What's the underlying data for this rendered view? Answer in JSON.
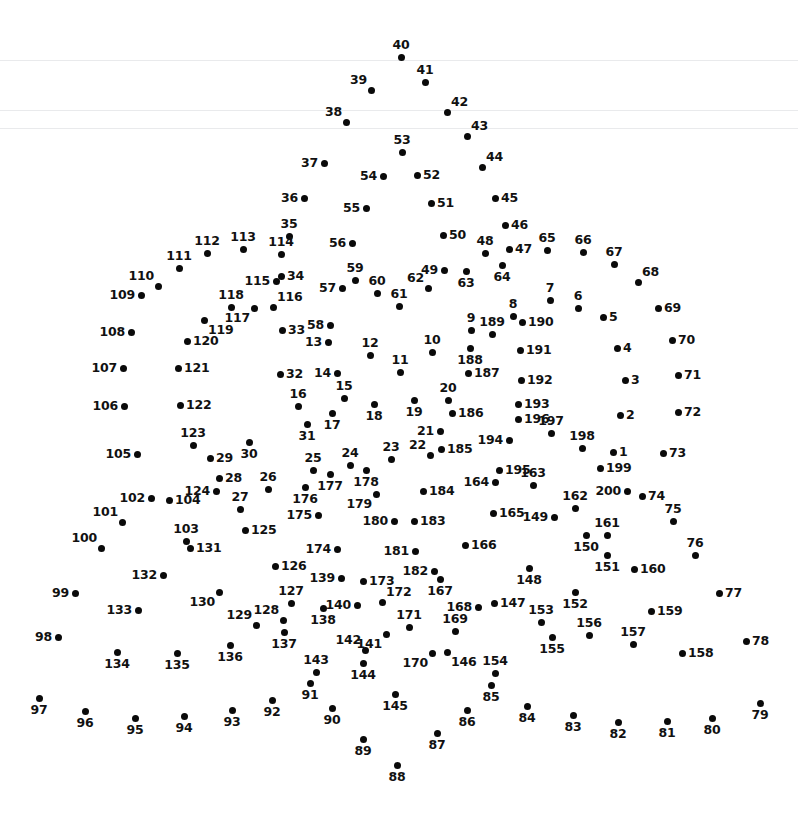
{
  "page": {
    "width": 798,
    "height": 815,
    "background_color": "#ffffff",
    "dot_color": "#0a0a0a",
    "label_color": "#111111",
    "dot_count": 200,
    "rule_color": "#e9eaec"
  },
  "faint_rules": [
    {
      "y": 60
    },
    {
      "y": 110
    },
    {
      "y": 128
    }
  ],
  "dots": [
    {
      "n": "1",
      "x": 613,
      "y": 452,
      "pos": "right"
    },
    {
      "n": "2",
      "x": 620,
      "y": 415,
      "pos": "right"
    },
    {
      "n": "3",
      "x": 625,
      "y": 380,
      "pos": "right"
    },
    {
      "n": "4",
      "x": 617,
      "y": 348,
      "pos": "right"
    },
    {
      "n": "5",
      "x": 603,
      "y": 317,
      "pos": "right"
    },
    {
      "n": "6",
      "x": 578,
      "y": 308,
      "pos": "above"
    },
    {
      "n": "7",
      "x": 550,
      "y": 300,
      "pos": "above"
    },
    {
      "n": "8",
      "x": 513,
      "y": 316,
      "pos": "above"
    },
    {
      "n": "9",
      "x": 471,
      "y": 330,
      "pos": "above"
    },
    {
      "n": "10",
      "x": 432,
      "y": 352,
      "pos": "above"
    },
    {
      "n": "11",
      "x": 400,
      "y": 372,
      "pos": "above"
    },
    {
      "n": "12",
      "x": 370,
      "y": 355,
      "pos": "above"
    },
    {
      "n": "13",
      "x": 328,
      "y": 342,
      "pos": "left"
    },
    {
      "n": "14",
      "x": 337,
      "y": 373,
      "pos": "left"
    },
    {
      "n": "15",
      "x": 344,
      "y": 398,
      "pos": "above"
    },
    {
      "n": "16",
      "x": 298,
      "y": 406,
      "pos": "above"
    },
    {
      "n": "17",
      "x": 332,
      "y": 413,
      "pos": "below"
    },
    {
      "n": "18",
      "x": 374,
      "y": 404,
      "pos": "below"
    },
    {
      "n": "19",
      "x": 414,
      "y": 400,
      "pos": "below"
    },
    {
      "n": "20",
      "x": 448,
      "y": 400,
      "pos": "above"
    },
    {
      "n": "21",
      "x": 440,
      "y": 431,
      "pos": "left"
    },
    {
      "n": "22",
      "x": 430,
      "y": 455,
      "pos": "above-left"
    },
    {
      "n": "23",
      "x": 391,
      "y": 459,
      "pos": "above"
    },
    {
      "n": "24",
      "x": 350,
      "y": 465,
      "pos": "above"
    },
    {
      "n": "25",
      "x": 313,
      "y": 470,
      "pos": "above"
    },
    {
      "n": "26",
      "x": 268,
      "y": 489,
      "pos": "above"
    },
    {
      "n": "27",
      "x": 240,
      "y": 509,
      "pos": "above"
    },
    {
      "n": "28",
      "x": 219,
      "y": 478,
      "pos": "right"
    },
    {
      "n": "29",
      "x": 210,
      "y": 458,
      "pos": "right"
    },
    {
      "n": "30",
      "x": 249,
      "y": 442,
      "pos": "below"
    },
    {
      "n": "31",
      "x": 307,
      "y": 424,
      "pos": "below"
    },
    {
      "n": "32",
      "x": 280,
      "y": 374,
      "pos": "right"
    },
    {
      "n": "33",
      "x": 282,
      "y": 330,
      "pos": "right"
    },
    {
      "n": "34",
      "x": 281,
      "y": 276,
      "pos": "right"
    },
    {
      "n": "35",
      "x": 289,
      "y": 236,
      "pos": "above"
    },
    {
      "n": "36",
      "x": 304,
      "y": 198,
      "pos": "left"
    },
    {
      "n": "37",
      "x": 324,
      "y": 163,
      "pos": "left"
    },
    {
      "n": "38",
      "x": 346,
      "y": 122,
      "pos": "above-left"
    },
    {
      "n": "39",
      "x": 371,
      "y": 90,
      "pos": "above-left"
    },
    {
      "n": "40",
      "x": 401,
      "y": 57,
      "pos": "above"
    },
    {
      "n": "41",
      "x": 425,
      "y": 82,
      "pos": "above"
    },
    {
      "n": "42",
      "x": 447,
      "y": 112,
      "pos": "above-right"
    },
    {
      "n": "43",
      "x": 467,
      "y": 136,
      "pos": "above-right"
    },
    {
      "n": "44",
      "x": 482,
      "y": 167,
      "pos": "above-right"
    },
    {
      "n": "45",
      "x": 495,
      "y": 198,
      "pos": "right"
    },
    {
      "n": "46",
      "x": 505,
      "y": 225,
      "pos": "right"
    },
    {
      "n": "47",
      "x": 509,
      "y": 249,
      "pos": "right"
    },
    {
      "n": "48",
      "x": 485,
      "y": 253,
      "pos": "above"
    },
    {
      "n": "49",
      "x": 444,
      "y": 270,
      "pos": "left"
    },
    {
      "n": "50",
      "x": 443,
      "y": 235,
      "pos": "right"
    },
    {
      "n": "51",
      "x": 431,
      "y": 203,
      "pos": "right"
    },
    {
      "n": "52",
      "x": 417,
      "y": 175,
      "pos": "right"
    },
    {
      "n": "53",
      "x": 402,
      "y": 152,
      "pos": "above"
    },
    {
      "n": "54",
      "x": 383,
      "y": 176,
      "pos": "left"
    },
    {
      "n": "55",
      "x": 366,
      "y": 208,
      "pos": "left"
    },
    {
      "n": "56",
      "x": 352,
      "y": 243,
      "pos": "left"
    },
    {
      "n": "57",
      "x": 342,
      "y": 288,
      "pos": "left"
    },
    {
      "n": "58",
      "x": 330,
      "y": 325,
      "pos": "left"
    },
    {
      "n": "59",
      "x": 355,
      "y": 280,
      "pos": "above"
    },
    {
      "n": "60",
      "x": 377,
      "y": 293,
      "pos": "above"
    },
    {
      "n": "61",
      "x": 399,
      "y": 306,
      "pos": "above"
    },
    {
      "n": "62",
      "x": 428,
      "y": 288,
      "pos": "above-left"
    },
    {
      "n": "63",
      "x": 466,
      "y": 271,
      "pos": "below"
    },
    {
      "n": "64",
      "x": 502,
      "y": 265,
      "pos": "below"
    },
    {
      "n": "65",
      "x": 547,
      "y": 250,
      "pos": "above"
    },
    {
      "n": "66",
      "x": 583,
      "y": 252,
      "pos": "above"
    },
    {
      "n": "67",
      "x": 614,
      "y": 264,
      "pos": "above"
    },
    {
      "n": "68",
      "x": 638,
      "y": 282,
      "pos": "above-right"
    },
    {
      "n": "69",
      "x": 658,
      "y": 308,
      "pos": "right"
    },
    {
      "n": "70",
      "x": 672,
      "y": 340,
      "pos": "right"
    },
    {
      "n": "71",
      "x": 678,
      "y": 375,
      "pos": "right"
    },
    {
      "n": "72",
      "x": 678,
      "y": 412,
      "pos": "right"
    },
    {
      "n": "73",
      "x": 663,
      "y": 453,
      "pos": "right"
    },
    {
      "n": "74",
      "x": 642,
      "y": 496,
      "pos": "right"
    },
    {
      "n": "75",
      "x": 673,
      "y": 521,
      "pos": "above"
    },
    {
      "n": "76",
      "x": 695,
      "y": 555,
      "pos": "above"
    },
    {
      "n": "77",
      "x": 719,
      "y": 593,
      "pos": "right"
    },
    {
      "n": "78",
      "x": 746,
      "y": 641,
      "pos": "right"
    },
    {
      "n": "79",
      "x": 760,
      "y": 703,
      "pos": "below"
    },
    {
      "n": "80",
      "x": 712,
      "y": 718,
      "pos": "below"
    },
    {
      "n": "81",
      "x": 667,
      "y": 721,
      "pos": "below"
    },
    {
      "n": "82",
      "x": 618,
      "y": 722,
      "pos": "below"
    },
    {
      "n": "83",
      "x": 573,
      "y": 715,
      "pos": "below"
    },
    {
      "n": "84",
      "x": 527,
      "y": 706,
      "pos": "below"
    },
    {
      "n": "85",
      "x": 491,
      "y": 685,
      "pos": "below"
    },
    {
      "n": "86",
      "x": 467,
      "y": 710,
      "pos": "below"
    },
    {
      "n": "87",
      "x": 437,
      "y": 733,
      "pos": "below"
    },
    {
      "n": "88",
      "x": 397,
      "y": 765,
      "pos": "below"
    },
    {
      "n": "89",
      "x": 363,
      "y": 739,
      "pos": "below"
    },
    {
      "n": "90",
      "x": 332,
      "y": 708,
      "pos": "below"
    },
    {
      "n": "91",
      "x": 310,
      "y": 683,
      "pos": "below"
    },
    {
      "n": "92",
      "x": 272,
      "y": 700,
      "pos": "below"
    },
    {
      "n": "93",
      "x": 232,
      "y": 710,
      "pos": "below"
    },
    {
      "n": "94",
      "x": 184,
      "y": 716,
      "pos": "below"
    },
    {
      "n": "95",
      "x": 135,
      "y": 718,
      "pos": "below"
    },
    {
      "n": "96",
      "x": 85,
      "y": 711,
      "pos": "below"
    },
    {
      "n": "97",
      "x": 39,
      "y": 698,
      "pos": "below"
    },
    {
      "n": "98",
      "x": 58,
      "y": 637,
      "pos": "left"
    },
    {
      "n": "99",
      "x": 75,
      "y": 593,
      "pos": "left"
    },
    {
      "n": "100",
      "x": 101,
      "y": 548,
      "pos": "above-left"
    },
    {
      "n": "101",
      "x": 122,
      "y": 522,
      "pos": "above-left"
    },
    {
      "n": "102",
      "x": 151,
      "y": 498,
      "pos": "left"
    },
    {
      "n": "103",
      "x": 186,
      "y": 541,
      "pos": "above"
    },
    {
      "n": "104",
      "x": 169,
      "y": 500,
      "pos": "right"
    },
    {
      "n": "105",
      "x": 137,
      "y": 454,
      "pos": "left"
    },
    {
      "n": "106",
      "x": 124,
      "y": 406,
      "pos": "left"
    },
    {
      "n": "107",
      "x": 123,
      "y": 368,
      "pos": "left"
    },
    {
      "n": "108",
      "x": 131,
      "y": 332,
      "pos": "left"
    },
    {
      "n": "109",
      "x": 141,
      "y": 295,
      "pos": "left"
    },
    {
      "n": "110",
      "x": 158,
      "y": 286,
      "pos": "above-left"
    },
    {
      "n": "111",
      "x": 179,
      "y": 268,
      "pos": "above"
    },
    {
      "n": "112",
      "x": 207,
      "y": 253,
      "pos": "above"
    },
    {
      "n": "113",
      "x": 243,
      "y": 249,
      "pos": "above"
    },
    {
      "n": "114",
      "x": 281,
      "y": 254,
      "pos": "above"
    },
    {
      "n": "115",
      "x": 276,
      "y": 281,
      "pos": "left"
    },
    {
      "n": "116",
      "x": 273,
      "y": 307,
      "pos": "above-right"
    },
    {
      "n": "117",
      "x": 254,
      "y": 308,
      "pos": "below-left"
    },
    {
      "n": "118",
      "x": 231,
      "y": 307,
      "pos": "above"
    },
    {
      "n": "119",
      "x": 204,
      "y": 320,
      "pos": "below-right"
    },
    {
      "n": "120",
      "x": 187,
      "y": 341,
      "pos": "right"
    },
    {
      "n": "121",
      "x": 178,
      "y": 368,
      "pos": "right"
    },
    {
      "n": "122",
      "x": 180,
      "y": 405,
      "pos": "right"
    },
    {
      "n": "123",
      "x": 193,
      "y": 445,
      "pos": "above"
    },
    {
      "n": "124",
      "x": 216,
      "y": 491,
      "pos": "left"
    },
    {
      "n": "125",
      "x": 245,
      "y": 530,
      "pos": "right"
    },
    {
      "n": "126",
      "x": 275,
      "y": 566,
      "pos": "right"
    },
    {
      "n": "127",
      "x": 291,
      "y": 603,
      "pos": "above"
    },
    {
      "n": "128",
      "x": 283,
      "y": 620,
      "pos": "above-left"
    },
    {
      "n": "129",
      "x": 256,
      "y": 625,
      "pos": "above-left"
    },
    {
      "n": "130",
      "x": 219,
      "y": 592,
      "pos": "below-left"
    },
    {
      "n": "131",
      "x": 190,
      "y": 548,
      "pos": "right"
    },
    {
      "n": "132",
      "x": 163,
      "y": 575,
      "pos": "left"
    },
    {
      "n": "133",
      "x": 138,
      "y": 610,
      "pos": "left"
    },
    {
      "n": "134",
      "x": 117,
      "y": 652,
      "pos": "below"
    },
    {
      "n": "135",
      "x": 177,
      "y": 653,
      "pos": "below"
    },
    {
      "n": "136",
      "x": 230,
      "y": 645,
      "pos": "below"
    },
    {
      "n": "137",
      "x": 284,
      "y": 632,
      "pos": "below"
    },
    {
      "n": "138",
      "x": 323,
      "y": 608,
      "pos": "below"
    },
    {
      "n": "139",
      "x": 341,
      "y": 578,
      "pos": "left"
    },
    {
      "n": "140",
      "x": 357,
      "y": 605,
      "pos": "left"
    },
    {
      "n": "141",
      "x": 386,
      "y": 634,
      "pos": "below-left"
    },
    {
      "n": "142",
      "x": 365,
      "y": 650,
      "pos": "above-left"
    },
    {
      "n": "143",
      "x": 316,
      "y": 672,
      "pos": "above"
    },
    {
      "n": "144",
      "x": 363,
      "y": 663,
      "pos": "below"
    },
    {
      "n": "145",
      "x": 395,
      "y": 694,
      "pos": "below"
    },
    {
      "n": "146",
      "x": 447,
      "y": 652,
      "pos": "below-right"
    },
    {
      "n": "147",
      "x": 494,
      "y": 603,
      "pos": "right"
    },
    {
      "n": "148",
      "x": 529,
      "y": 568,
      "pos": "below"
    },
    {
      "n": "149",
      "x": 554,
      "y": 517,
      "pos": "left"
    },
    {
      "n": "150",
      "x": 586,
      "y": 535,
      "pos": "below"
    },
    {
      "n": "151",
      "x": 607,
      "y": 555,
      "pos": "below"
    },
    {
      "n": "152",
      "x": 575,
      "y": 592,
      "pos": "below"
    },
    {
      "n": "153",
      "x": 541,
      "y": 622,
      "pos": "above"
    },
    {
      "n": "154",
      "x": 495,
      "y": 673,
      "pos": "above"
    },
    {
      "n": "155",
      "x": 552,
      "y": 637,
      "pos": "below"
    },
    {
      "n": "156",
      "x": 589,
      "y": 635,
      "pos": "above"
    },
    {
      "n": "157",
      "x": 633,
      "y": 644,
      "pos": "above"
    },
    {
      "n": "158",
      "x": 682,
      "y": 653,
      "pos": "right"
    },
    {
      "n": "159",
      "x": 651,
      "y": 611,
      "pos": "right"
    },
    {
      "n": "160",
      "x": 634,
      "y": 569,
      "pos": "right"
    },
    {
      "n": "161",
      "x": 607,
      "y": 535,
      "pos": "above"
    },
    {
      "n": "162",
      "x": 575,
      "y": 508,
      "pos": "above"
    },
    {
      "n": "163",
      "x": 533,
      "y": 485,
      "pos": "above"
    },
    {
      "n": "164",
      "x": 495,
      "y": 482,
      "pos": "left"
    },
    {
      "n": "165",
      "x": 493,
      "y": 513,
      "pos": "right"
    },
    {
      "n": "166",
      "x": 465,
      "y": 545,
      "pos": "right"
    },
    {
      "n": "167",
      "x": 440,
      "y": 579,
      "pos": "below"
    },
    {
      "n": "168",
      "x": 478,
      "y": 607,
      "pos": "left"
    },
    {
      "n": "169",
      "x": 455,
      "y": 631,
      "pos": "above"
    },
    {
      "n": "170",
      "x": 432,
      "y": 653,
      "pos": "below-left"
    },
    {
      "n": "171",
      "x": 409,
      "y": 627,
      "pos": "above"
    },
    {
      "n": "172",
      "x": 382,
      "y": 602,
      "pos": "above-right"
    },
    {
      "n": "173",
      "x": 363,
      "y": 581,
      "pos": "right"
    },
    {
      "n": "174",
      "x": 337,
      "y": 549,
      "pos": "left"
    },
    {
      "n": "175",
      "x": 318,
      "y": 515,
      "pos": "left"
    },
    {
      "n": "176",
      "x": 305,
      "y": 487,
      "pos": "below"
    },
    {
      "n": "177",
      "x": 330,
      "y": 474,
      "pos": "below"
    },
    {
      "n": "178",
      "x": 366,
      "y": 470,
      "pos": "below"
    },
    {
      "n": "179",
      "x": 376,
      "y": 494,
      "pos": "below-left"
    },
    {
      "n": "180",
      "x": 394,
      "y": 521,
      "pos": "left"
    },
    {
      "n": "181",
      "x": 415,
      "y": 551,
      "pos": "left"
    },
    {
      "n": "182",
      "x": 434,
      "y": 571,
      "pos": "left"
    },
    {
      "n": "183",
      "x": 414,
      "y": 521,
      "pos": "right"
    },
    {
      "n": "184",
      "x": 423,
      "y": 491,
      "pos": "right"
    },
    {
      "n": "185",
      "x": 441,
      "y": 449,
      "pos": "right"
    },
    {
      "n": "186",
      "x": 452,
      "y": 413,
      "pos": "right"
    },
    {
      "n": "187",
      "x": 468,
      "y": 373,
      "pos": "right"
    },
    {
      "n": "188",
      "x": 470,
      "y": 348,
      "pos": "below"
    },
    {
      "n": "189",
      "x": 492,
      "y": 334,
      "pos": "above"
    },
    {
      "n": "190",
      "x": 522,
      "y": 322,
      "pos": "right"
    },
    {
      "n": "191",
      "x": 520,
      "y": 350,
      "pos": "right"
    },
    {
      "n": "192",
      "x": 521,
      "y": 380,
      "pos": "right"
    },
    {
      "n": "193",
      "x": 518,
      "y": 404,
      "pos": "right"
    },
    {
      "n": "194",
      "x": 509,
      "y": 440,
      "pos": "left"
    },
    {
      "n": "195",
      "x": 499,
      "y": 470,
      "pos": "right"
    },
    {
      "n": "196",
      "x": 518,
      "y": 419,
      "pos": "right"
    },
    {
      "n": "197",
      "x": 551,
      "y": 433,
      "pos": "above"
    },
    {
      "n": "198",
      "x": 582,
      "y": 448,
      "pos": "above"
    },
    {
      "n": "199",
      "x": 600,
      "y": 468,
      "pos": "right"
    },
    {
      "n": "200",
      "x": 627,
      "y": 491,
      "pos": "left"
    }
  ]
}
